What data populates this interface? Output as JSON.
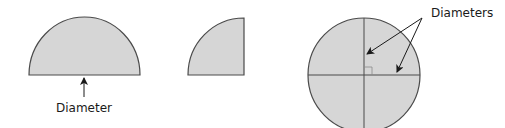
{
  "diagram": {
    "colors": {
      "fill": "#d6d6d6",
      "stroke": "#4a4a4a",
      "arrow": "#1a1a1a",
      "background": "#ffffff"
    },
    "shapes": [
      {
        "id": "semicircle",
        "type": "semicircle",
        "label": "Diameter"
      },
      {
        "id": "quadrant",
        "type": "quarter-circle"
      },
      {
        "id": "circle",
        "type": "circle",
        "label": "Diameters",
        "diameters": 2,
        "right_angle_marker": true
      }
    ],
    "labels": {
      "semicircle_label": "Diameter",
      "circle_label": "Diameters"
    }
  }
}
